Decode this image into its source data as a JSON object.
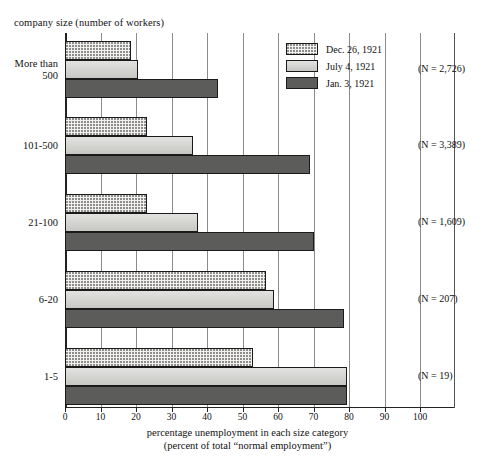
{
  "chart_data": {
    "type": "bar",
    "orientation": "horizontal",
    "title": "",
    "xlabel_line1": "percentage unemployment in each size category",
    "xlabel_line2": "(percent of total “normal employment”)",
    "ylabel": "company size (number of workers)",
    "categories": [
      "More than 500",
      "101-500",
      "21-100",
      "6-20",
      "1-5"
    ],
    "category_labels": [
      [
        "More than",
        "500"
      ],
      [
        "101-500"
      ],
      [
        "21-100"
      ],
      [
        "6-20"
      ],
      [
        "1-5"
      ]
    ],
    "series": [
      {
        "name": "Dec. 26, 1921",
        "pattern": "sparse-dots",
        "values": [
          18.5,
          23.0,
          23.0,
          56.5,
          53.0
        ]
      },
      {
        "name": "July 4, 1921",
        "pattern": "solid-gray",
        "values": [
          20.5,
          36.0,
          37.5,
          59.0,
          79.5
        ]
      },
      {
        "name": "Jan. 3, 1921",
        "pattern": "dense-checker",
        "values": [
          43.0,
          69.0,
          70.0,
          78.5,
          79.5
        ]
      }
    ],
    "xlim": [
      0,
      100
    ],
    "xticks": [
      0,
      10,
      20,
      30,
      40,
      50,
      60,
      70,
      80,
      90,
      100
    ],
    "xtick_labels": [
      "0",
      "10",
      "20",
      "30",
      "40",
      "50",
      "60",
      "70",
      "80",
      "90",
      "100"
    ],
    "grid": true,
    "grid_axis": "x",
    "legend_position": "top-right-inside",
    "annotations": [
      {
        "category": "More than 500",
        "text": "(N = 2,726)"
      },
      {
        "category": "101-500",
        "text": "(N = 3,389)"
      },
      {
        "category": "21-100",
        "text": "(N = 1,609)"
      },
      {
        "category": "6-20",
        "text": "(N = 207)"
      },
      {
        "category": "1-5",
        "text": "(N = 19)"
      }
    ],
    "colors": {
      "dec_26_1921": "#f2f1ee",
      "july_4_1921": "#d3d3d0",
      "jan_3_1921": "#9a9a97",
      "outline": "#1a1a1a",
      "gridline": "#8b8b8b",
      "axis": "#222222"
    }
  }
}
